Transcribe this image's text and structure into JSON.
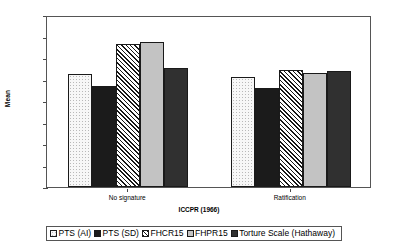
{
  "chart_data": {
    "type": "bar",
    "title": "",
    "xlabel": "ICCPR (1966)",
    "ylabel": "Mean",
    "ylim": [
      0,
      4
    ],
    "yticks": [
      "0",
      "0.5",
      "1",
      "1.5",
      "2",
      "2.5",
      "3",
      "3.5",
      "4"
    ],
    "ytick_values": [
      0,
      0.5,
      1,
      1.5,
      2,
      2.5,
      3,
      3.5,
      4
    ],
    "grid": false,
    "legend_position": "bottom",
    "categories": [
      "No signature",
      "Ratification"
    ],
    "series": [
      {
        "name": "PTS (AI)",
        "values": [
          2.62,
          2.57
        ],
        "fill": "white-dotted"
      },
      {
        "name": "PTS (SD)",
        "values": [
          2.35,
          2.31
        ],
        "fill": "black-solid"
      },
      {
        "name": "FHCR15",
        "values": [
          3.32,
          2.72
        ],
        "fill": "diagonal-hatch"
      },
      {
        "name": "FHPR15",
        "values": [
          3.37,
          2.65
        ],
        "fill": "light-grey-solid"
      },
      {
        "name": "Torture Scale (Hathaway)",
        "values": [
          2.77,
          2.7
        ],
        "fill": "dark-grey-solid"
      }
    ]
  },
  "colors": {
    "axis": "#4a4a4a",
    "frame": "#555555",
    "bar_border": "#1a1a1a",
    "series_pts_ai": "#f7f7f7",
    "series_pts_sd": "#1b1b1b",
    "series_fhcr15": "#ffffff",
    "series_fhpr15": "#c3c3c3",
    "series_torture": "#303030",
    "background": "#ffffff"
  }
}
